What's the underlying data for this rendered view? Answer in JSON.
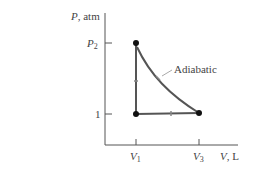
{
  "diagram": {
    "type": "pv-diagram",
    "y_axis": {
      "label_var": "P",
      "label_unit": ", atm",
      "ticks": [
        {
          "label": "P",
          "sub": "2",
          "value": "P2"
        },
        {
          "label": "1",
          "sub": "",
          "value": 1
        }
      ]
    },
    "x_axis": {
      "label_var": "V",
      "label_unit": ", L",
      "ticks": [
        {
          "label": "V",
          "sub": "1"
        },
        {
          "label": "V",
          "sub": "3"
        }
      ]
    },
    "points": [
      {
        "name": "state-1",
        "V": "V1",
        "P": "P2"
      },
      {
        "name": "state-2",
        "V": "V1",
        "P": 1
      },
      {
        "name": "state-3",
        "V": "V3",
        "P": 1
      }
    ],
    "paths": [
      {
        "name": "isochoric",
        "from": "V1,1",
        "to": "V1,P2"
      },
      {
        "name": "adiabatic",
        "from": "V1,P2",
        "to": "V3,1",
        "label": "Adiabatic"
      },
      {
        "name": "isobaric",
        "from": "V3,1",
        "to": "V1,1"
      }
    ],
    "colors": {
      "axis": "#555555",
      "path": "#444444",
      "point": "#111111",
      "label": "#444444"
    }
  }
}
